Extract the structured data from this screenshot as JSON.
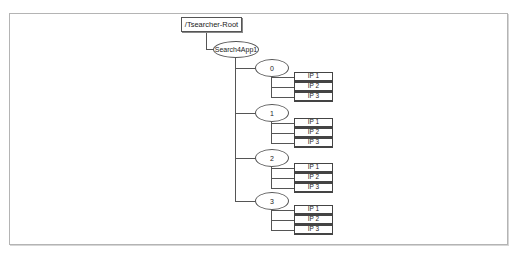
{
  "diagram": {
    "root": {
      "label": "/Tsearcher-Root"
    },
    "app": {
      "label": "Search4App1"
    },
    "groups": [
      {
        "label": "0",
        "items": [
          "IP 1",
          "IP 2",
          "IP 3"
        ]
      },
      {
        "label": "1",
        "items": [
          "IP 1",
          "IP 2",
          "IP 3"
        ]
      },
      {
        "label": "2",
        "items": [
          "IP 1",
          "IP 2",
          "IP 3"
        ]
      },
      {
        "label": "3",
        "items": [
          "IP 1",
          "IP 2",
          "IP 3"
        ]
      }
    ]
  },
  "colors": {
    "line": "#555555",
    "frame": "#b4b4b4",
    "background": "#ffffff"
  }
}
